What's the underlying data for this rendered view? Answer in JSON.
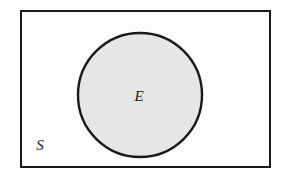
{
  "diagram": {
    "type": "venn-diagram",
    "title": "",
    "background_color": "#ffffff",
    "universe": {
      "name": "sample-space",
      "label": "S",
      "shape": "rectangle",
      "fill_color": "#fdfdfd",
      "stroke_color": "#1a1a1a",
      "stroke_width": 2,
      "x": 21,
      "y": 11,
      "width": 249,
      "height": 156,
      "label_x": 40,
      "label_y": 150
    },
    "event": {
      "name": "event-set",
      "label": "E",
      "shape": "circle",
      "fill_color": "#e6e6e6",
      "stroke_color": "#1a1a1a",
      "stroke_width": 2.4,
      "center_x": 140,
      "center_y": 95,
      "radius": 62,
      "label_x": 139,
      "label_y": 101
    }
  }
}
